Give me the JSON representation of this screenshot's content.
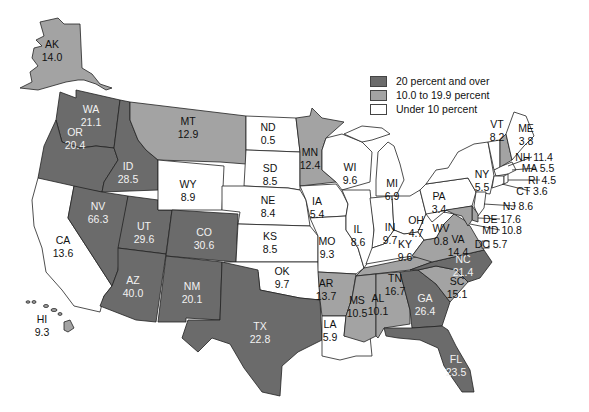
{
  "legend": {
    "items": [
      {
        "label": "20 percent and over",
        "color": "#6b6b6b"
      },
      {
        "label": "10.0 to 19.9 percent",
        "color": "#a3a3a3"
      },
      {
        "label": "Under 10 percent",
        "color": "#ffffff"
      }
    ]
  },
  "colors": {
    "dark": "#6b6b6b",
    "medium": "#a3a3a3",
    "light": "#ffffff",
    "border": "#222222"
  },
  "states": [
    {
      "abbr": "AK",
      "value": "14.0",
      "class": "medium"
    },
    {
      "abbr": "WA",
      "value": "21.1",
      "class": "dark"
    },
    {
      "abbr": "OR",
      "value": "20.4",
      "class": "dark"
    },
    {
      "abbr": "CA",
      "value": "13.6",
      "class": "light"
    },
    {
      "abbr": "ID",
      "value": "28.5",
      "class": "dark"
    },
    {
      "abbr": "NV",
      "value": "66.3",
      "class": "dark"
    },
    {
      "abbr": "UT",
      "value": "29.6",
      "class": "dark"
    },
    {
      "abbr": "AZ",
      "value": "40.0",
      "class": "dark"
    },
    {
      "abbr": "MT",
      "value": "12.9",
      "class": "medium"
    },
    {
      "abbr": "WY",
      "value": "8.9",
      "class": "light"
    },
    {
      "abbr": "CO",
      "value": "30.6",
      "class": "dark"
    },
    {
      "abbr": "NM",
      "value": "20.1",
      "class": "dark"
    },
    {
      "abbr": "ND",
      "value": "0.5",
      "class": "light"
    },
    {
      "abbr": "SD",
      "value": "8.5",
      "class": "light"
    },
    {
      "abbr": "NE",
      "value": "8.4",
      "class": "light"
    },
    {
      "abbr": "KS",
      "value": "8.5",
      "class": "light"
    },
    {
      "abbr": "OK",
      "value": "9.7",
      "class": "light"
    },
    {
      "abbr": "TX",
      "value": "22.8",
      "class": "dark"
    },
    {
      "abbr": "MN",
      "value": "12.4",
      "class": "medium"
    },
    {
      "abbr": "IA",
      "value": "5.4",
      "class": "light"
    },
    {
      "abbr": "MO",
      "value": "9.3",
      "class": "light"
    },
    {
      "abbr": "AR",
      "value": "13.7",
      "class": "medium"
    },
    {
      "abbr": "LA",
      "value": "5.9",
      "class": "light"
    },
    {
      "abbr": "WI",
      "value": "9.6",
      "class": "light"
    },
    {
      "abbr": "IL",
      "value": "8.6",
      "class": "light"
    },
    {
      "abbr": "MI",
      "value": "6.9",
      "class": "light"
    },
    {
      "abbr": "IN",
      "value": "9.7",
      "class": "light"
    },
    {
      "abbr": "OH",
      "value": "4.7",
      "class": "light"
    },
    {
      "abbr": "KY",
      "value": "9.6",
      "class": "light"
    },
    {
      "abbr": "TN",
      "value": "16.7",
      "class": "medium"
    },
    {
      "abbr": "MS",
      "value": "10.5",
      "class": "medium"
    },
    {
      "abbr": "AL",
      "value": "10.1",
      "class": "medium"
    },
    {
      "abbr": "GA",
      "value": "26.4",
      "class": "dark"
    },
    {
      "abbr": "FL",
      "value": "23.5",
      "class": "dark"
    },
    {
      "abbr": "SC",
      "value": "15.1",
      "class": "medium"
    },
    {
      "abbr": "NC",
      "value": "21.4",
      "class": "dark"
    },
    {
      "abbr": "VA",
      "value": "14.4",
      "class": "medium"
    },
    {
      "abbr": "WV",
      "value": "0.8",
      "class": "light"
    },
    {
      "abbr": "PA",
      "value": "3.4",
      "class": "light"
    },
    {
      "abbr": "NY",
      "value": "5.5",
      "class": "light"
    },
    {
      "abbr": "VT",
      "value": "8.2",
      "class": "light"
    },
    {
      "abbr": "ME",
      "value": "3.8",
      "class": "light"
    },
    {
      "abbr": "NH",
      "value": "11.4",
      "class": "medium"
    },
    {
      "abbr": "MA",
      "value": "5.5",
      "class": "light"
    },
    {
      "abbr": "RI",
      "value": "4.5",
      "class": "light"
    },
    {
      "abbr": "CT",
      "value": "3.6",
      "class": "light"
    },
    {
      "abbr": "NJ",
      "value": "8.6",
      "class": "light"
    },
    {
      "abbr": "DE",
      "value": "17.6",
      "class": "medium"
    },
    {
      "abbr": "MD",
      "value": "10.8",
      "class": "medium"
    },
    {
      "abbr": "DC",
      "value": "5.7",
      "class": "light"
    },
    {
      "abbr": "HI",
      "value": "9.3",
      "class": "medium"
    }
  ],
  "callouts": {
    "NH": "NH 11.4",
    "MA": "MA 5.5",
    "RI": "RI 4.5",
    "CT": "CT 3.6",
    "NJ": "NJ 8.6",
    "DE": "DE 17.6",
    "MD": "MD 10.8",
    "DC": "DC 5.7"
  }
}
